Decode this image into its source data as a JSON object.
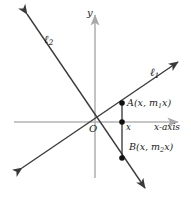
{
  "figure": {
    "colors": {
      "axis": "#b3b3b3",
      "line": "#3a3a3a",
      "point": "#111111",
      "text": "#1a1a1a",
      "background": "#ffffff"
    },
    "labels": {
      "line1": "ℓ",
      "line1_sub": "1",
      "line2": "ℓ",
      "line2_sub": "2",
      "y_axis": "y",
      "x_axis": "x-axis",
      "origin": "O",
      "x_foot": "x",
      "point_a_name": "A",
      "point_a_coords_pre": "(x, m",
      "point_a_sub": "1",
      "point_a_coords_post": "x)",
      "point_b_name": "B",
      "point_b_coords_pre": "(x, m",
      "point_b_sub": "2",
      "point_b_coords_post": "x)"
    },
    "geometry": {
      "origin": {
        "x": 95,
        "y": 122
      },
      "x_axis": {
        "x1": 14,
        "y1": 122,
        "x2": 180,
        "y2": 122
      },
      "y_axis": {
        "x1": 95,
        "y1": 178,
        "x2": 95,
        "y2": 14
      },
      "line1": {
        "x1": 22,
        "y1": 168,
        "x2": 178,
        "y2": 62
      },
      "line2": {
        "x1": 27,
        "y1": 14,
        "x2": 145,
        "y2": 188
      },
      "vertical_segment": {
        "x": 122,
        "y_top": 103,
        "y_bottom": 158
      },
      "points": [
        {
          "name": "A",
          "x": 122,
          "y": 103
        },
        {
          "name": "foot",
          "x": 122,
          "y": 122
        },
        {
          "name": "B",
          "x": 122,
          "y": 158
        }
      ]
    }
  }
}
